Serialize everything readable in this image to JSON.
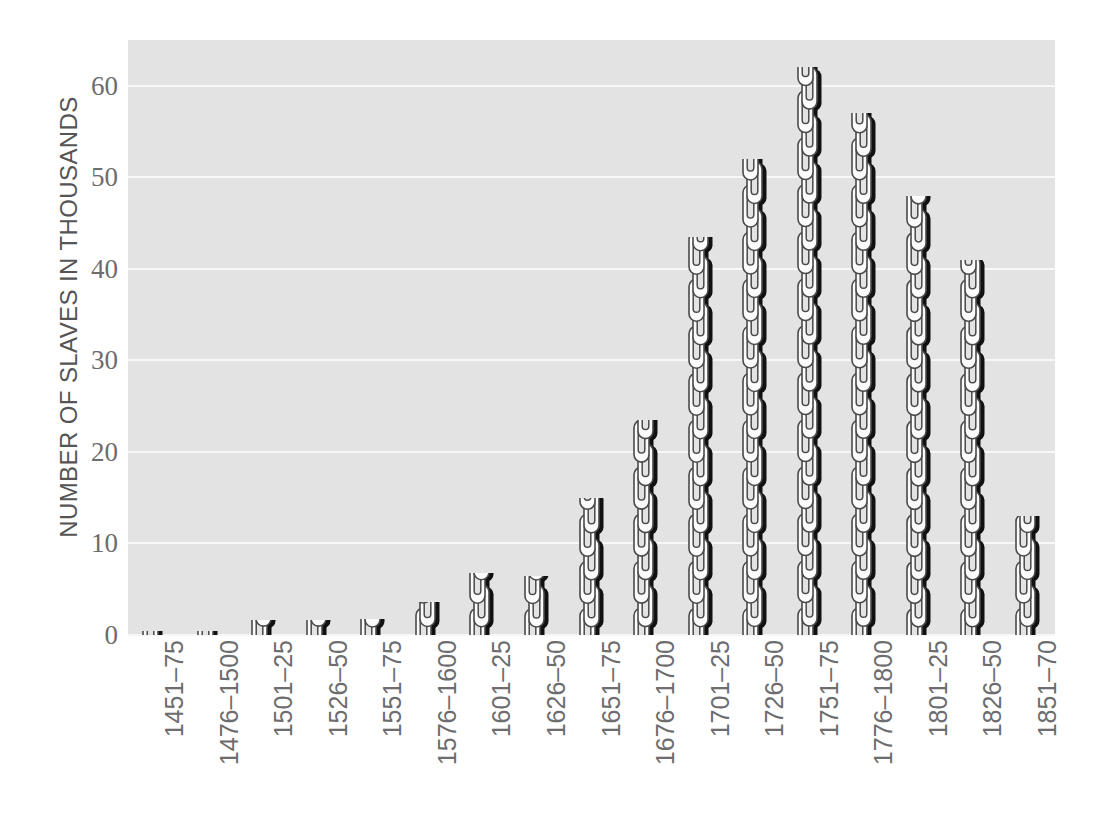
{
  "chart_data": {
    "type": "bar",
    "title": "",
    "subtitle": "",
    "xlabel": "",
    "ylabel": "NUMBER OF SLAVES IN THOUSANDS",
    "ylim": [
      0,
      65
    ],
    "yticks": [
      0,
      10,
      20,
      30,
      40,
      50,
      60
    ],
    "ytick_labels": [
      "0",
      "10",
      "20",
      "30",
      "40",
      "50",
      "60"
    ],
    "grid": true,
    "legend": null,
    "bar_style": "chain-link-pictogram",
    "categories": [
      "1451–75",
      "1476–1500",
      "1501–25",
      "1526–50",
      "1551–75",
      "1576–1600",
      "1601–25",
      "1626–50",
      "1651–75",
      "1676–1700",
      "1701–25",
      "1726–50",
      "1751–75",
      "1776–1800",
      "1801–25",
      "1826–50",
      "1851–70"
    ],
    "values": [
      0.4,
      0.4,
      1.6,
      1.6,
      1.8,
      3.6,
      6.8,
      6.5,
      15.0,
      23.5,
      43.5,
      52.0,
      62.0,
      57.0,
      48.0,
      41.0,
      13.0
    ]
  },
  "colors": {
    "plot_background": "#e3e3e3",
    "page_background": "#ffffff",
    "gridline": "#f7f7f7",
    "tick_label": "#6d6c6e",
    "axis_title": "#555456",
    "chain_outline": "#4a4a4c",
    "chain_fill": "#fbfbfb",
    "chain_shadow": "#111111"
  }
}
